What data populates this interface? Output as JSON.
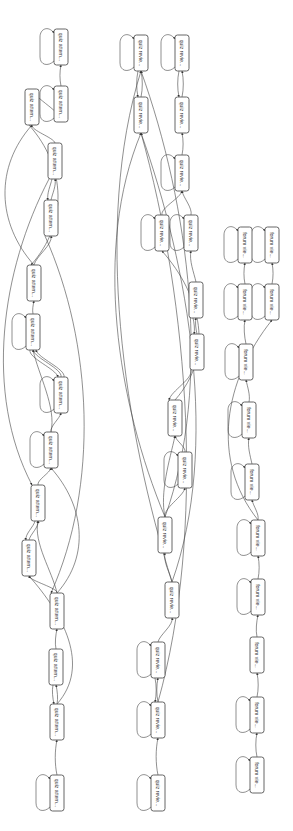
{
  "diagram": {
    "type": "process-map",
    "orientation": "rotated-90",
    "colors": {
      "background": "#ffffff",
      "node_fill": "#ffffff",
      "node_stroke": "#555555",
      "edge": "#444444",
      "text": "#333333"
    },
    "clusters": [
      {
        "id": "quiz-attempt",
        "label": "quiz attem..."
      },
      {
        "id": "quiz-review",
        "label": "quiz revie..."
      },
      {
        "id": "forum-view",
        "label": "forum vie..."
      }
    ],
    "nodes": [
      {
        "id": "A1",
        "label": "quiz attem...",
        "x": 61,
        "y": 47,
        "loop": true
      },
      {
        "id": "A2",
        "label": "quiz attem...",
        "x": 61,
        "y": 104,
        "loop": true
      },
      {
        "id": "A3",
        "label": "quiz attem...",
        "x": 32,
        "y": 107,
        "loop": false
      },
      {
        "id": "A4",
        "label": "quiz attem...",
        "x": 55,
        "y": 161,
        "loop": false
      },
      {
        "id": "A5",
        "label": "quiz attem...",
        "x": 51,
        "y": 218,
        "loop": false
      },
      {
        "id": "A6",
        "label": "quiz attem...",
        "x": 34,
        "y": 283,
        "loop": false
      },
      {
        "id": "A7",
        "label": "quiz attem...",
        "x": 33,
        "y": 332,
        "loop": true
      },
      {
        "id": "A8",
        "label": "quiz attem...",
        "x": 61,
        "y": 395,
        "loop": true
      },
      {
        "id": "A9",
        "label": "quiz attem...",
        "x": 51,
        "y": 450,
        "loop": true
      },
      {
        "id": "A10",
        "label": "quiz attem...",
        "x": 38,
        "y": 503,
        "loop": false
      },
      {
        "id": "A11",
        "label": "quiz attem...",
        "x": 29,
        "y": 558,
        "loop": false
      },
      {
        "id": "A12",
        "label": "quiz attem...",
        "x": 57,
        "y": 611,
        "loop": false
      },
      {
        "id": "A13",
        "label": "quiz attem...",
        "x": 56,
        "y": 667,
        "loop": false
      },
      {
        "id": "A14",
        "label": "quiz attem...",
        "x": 57,
        "y": 722,
        "loop": false
      },
      {
        "id": "A15",
        "label": "quiz attem...",
        "x": 57,
        "y": 793,
        "loop": true
      },
      {
        "id": "R1",
        "label": "quiz revie...",
        "x": 141,
        "y": 53,
        "loop": true
      },
      {
        "id": "R2",
        "label": "quiz revie...",
        "x": 182,
        "y": 53,
        "loop": true
      },
      {
        "id": "R3",
        "label": "quiz revie...",
        "x": 141,
        "y": 115,
        "loop": false
      },
      {
        "id": "R4",
        "label": "quiz revie...",
        "x": 182,
        "y": 115,
        "loop": false
      },
      {
        "id": "R5",
        "label": "quiz revie...",
        "x": 182,
        "y": 173,
        "loop": true
      },
      {
        "id": "R6",
        "label": "quiz revie...",
        "x": 162,
        "y": 233,
        "loop": true
      },
      {
        "id": "R7",
        "label": "quiz revie...",
        "x": 191,
        "y": 233,
        "loop": true
      },
      {
        "id": "R8",
        "label": "quiz revie...",
        "x": 196,
        "y": 300,
        "loop": false
      },
      {
        "id": "R9",
        "label": "quiz revie...",
        "x": 197,
        "y": 352,
        "loop": false
      },
      {
        "id": "R10",
        "label": "quiz revie...",
        "x": 175,
        "y": 418,
        "loop": false
      },
      {
        "id": "R11",
        "label": "quiz revie...",
        "x": 185,
        "y": 470,
        "loop": true
      },
      {
        "id": "R12",
        "label": "quiz revie...",
        "x": 165,
        "y": 535,
        "loop": false
      },
      {
        "id": "R13",
        "label": "quiz revie...",
        "x": 172,
        "y": 600,
        "loop": false
      },
      {
        "id": "R14",
        "label": "quiz revie...",
        "x": 158,
        "y": 660,
        "loop": true
      },
      {
        "id": "R15",
        "label": "quiz revie...",
        "x": 158,
        "y": 720,
        "loop": true
      },
      {
        "id": "R16",
        "label": "quiz revie...",
        "x": 158,
        "y": 793,
        "loop": true
      },
      {
        "id": "F1",
        "label": "forum vie...",
        "x": 245,
        "y": 245,
        "loop": true
      },
      {
        "id": "F2",
        "label": "forum vie...",
        "x": 272,
        "y": 245,
        "loop": true
      },
      {
        "id": "F3",
        "label": "forum vie...",
        "x": 245,
        "y": 302,
        "loop": true
      },
      {
        "id": "F4",
        "label": "forum vie...",
        "x": 272,
        "y": 302,
        "loop": true
      },
      {
        "id": "F5",
        "label": "forum vie...",
        "x": 246,
        "y": 362,
        "loop": true
      },
      {
        "id": "F6",
        "label": "forum vie...",
        "x": 249,
        "y": 420,
        "loop": true
      },
      {
        "id": "F7",
        "label": "forum vie...",
        "x": 252,
        "y": 482,
        "loop": true
      },
      {
        "id": "F8",
        "label": "forum vie...",
        "x": 258,
        "y": 538,
        "loop": true
      },
      {
        "id": "F9",
        "label": "forum vie...",
        "x": 258,
        "y": 597,
        "loop": true
      },
      {
        "id": "F10",
        "label": "forum vie...",
        "x": 257,
        "y": 655,
        "loop": false
      },
      {
        "id": "F11",
        "label": "forum vie...",
        "x": 257,
        "y": 715,
        "loop": true
      },
      {
        "id": "F12",
        "label": "forum vie...",
        "x": 257,
        "y": 775,
        "loop": true
      }
    ],
    "edges": [
      [
        "A2",
        "A1"
      ],
      [
        "A3",
        "A2"
      ],
      [
        "A4",
        "A3"
      ],
      [
        "A5",
        "A4"
      ],
      [
        "A4",
        "A5"
      ],
      [
        "A6",
        "A5"
      ],
      [
        "A6",
        "A3"
      ],
      [
        "A3",
        "A6"
      ],
      [
        "A7",
        "A6"
      ],
      [
        "A8",
        "A7"
      ],
      [
        "A7",
        "A8"
      ],
      [
        "A8",
        "A7"
      ],
      [
        "A9",
        "A8"
      ],
      [
        "A9",
        "A7"
      ],
      [
        "A10",
        "A9"
      ],
      [
        "A11",
        "A10"
      ],
      [
        "A10",
        "A11"
      ],
      [
        "A12",
        "A11"
      ],
      [
        "A12",
        "A10"
      ],
      [
        "A12",
        "A9"
      ],
      [
        "A13",
        "A12"
      ],
      [
        "A14",
        "A13"
      ],
      [
        "A13",
        "A14"
      ],
      [
        "A14",
        "A11"
      ],
      [
        "A15",
        "A14"
      ],
      [
        "A5",
        "A12"
      ],
      [
        "A4",
        "A10"
      ],
      [
        "R3",
        "R1"
      ],
      [
        "R1",
        "R3"
      ],
      [
        "R4",
        "R2"
      ],
      [
        "R2",
        "R4"
      ],
      [
        "R5",
        "R4"
      ],
      [
        "R6",
        "R5"
      ],
      [
        "R7",
        "R5"
      ],
      [
        "R8",
        "R7"
      ],
      [
        "R10",
        "R6"
      ],
      [
        "R9",
        "R8"
      ],
      [
        "R8",
        "R9"
      ],
      [
        "R12",
        "R10"
      ],
      [
        "R9",
        "R10"
      ],
      [
        "R12",
        "R11"
      ],
      [
        "R11",
        "R10"
      ],
      [
        "R13",
        "R12"
      ],
      [
        "R13",
        "R3"
      ],
      [
        "R13",
        "R1"
      ],
      [
        "R14",
        "R13"
      ],
      [
        "R15",
        "R14"
      ],
      [
        "R14",
        "R15"
      ],
      [
        "R16",
        "R15"
      ],
      [
        "R15",
        "R3"
      ],
      [
        "R12",
        "R3"
      ],
      [
        "R12",
        "R1"
      ],
      [
        "F3",
        "F1"
      ],
      [
        "F4",
        "F2"
      ],
      [
        "F5",
        "F3"
      ],
      [
        "F6",
        "F5"
      ],
      [
        "F7",
        "F6"
      ],
      [
        "F8",
        "F7"
      ],
      [
        "F8",
        "F4"
      ],
      [
        "F9",
        "F8"
      ],
      [
        "F10",
        "F9"
      ],
      [
        "F11",
        "F10"
      ],
      [
        "F12",
        "F11"
      ]
    ]
  }
}
